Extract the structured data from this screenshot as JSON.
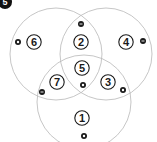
{
  "badge": {
    "label": "5",
    "color": "#111111"
  },
  "colors": {
    "circle_outline": "#b8b8b8",
    "marker": "#1a1a1a",
    "marker_inner": "#ffffff"
  },
  "venn_circles": [
    {
      "name": "left",
      "cx": 56,
      "cy": 54,
      "r": 46
    },
    {
      "name": "right",
      "cx": 106,
      "cy": 54,
      "r": 46
    },
    {
      "name": "bottom",
      "cx": 84,
      "cy": 102,
      "r": 47
    }
  ],
  "regions": [
    {
      "label": "1",
      "cx": 82,
      "cy": 118,
      "marker": {
        "type": "ring",
        "x": 84,
        "y": 136
      }
    },
    {
      "label": "2",
      "cx": 81,
      "cy": 42,
      "marker": {
        "type": "minus",
        "x": 81,
        "y": 24
      }
    },
    {
      "label": "3",
      "cx": 108,
      "cy": 82,
      "marker": {
        "type": "ring",
        "x": 123,
        "y": 90
      }
    },
    {
      "label": "4",
      "cx": 126,
      "cy": 42,
      "marker": {
        "type": "minus",
        "x": 143,
        "y": 41
      }
    },
    {
      "label": "5",
      "cx": 82,
      "cy": 68,
      "marker": {
        "type": "ring",
        "x": 83,
        "y": 85
      }
    },
    {
      "label": "6",
      "cx": 34,
      "cy": 42,
      "marker": {
        "type": "ring",
        "x": 18,
        "y": 42
      }
    },
    {
      "label": "7",
      "cx": 57,
      "cy": 82,
      "marker": {
        "type": "minus",
        "x": 42,
        "y": 92
      }
    }
  ]
}
